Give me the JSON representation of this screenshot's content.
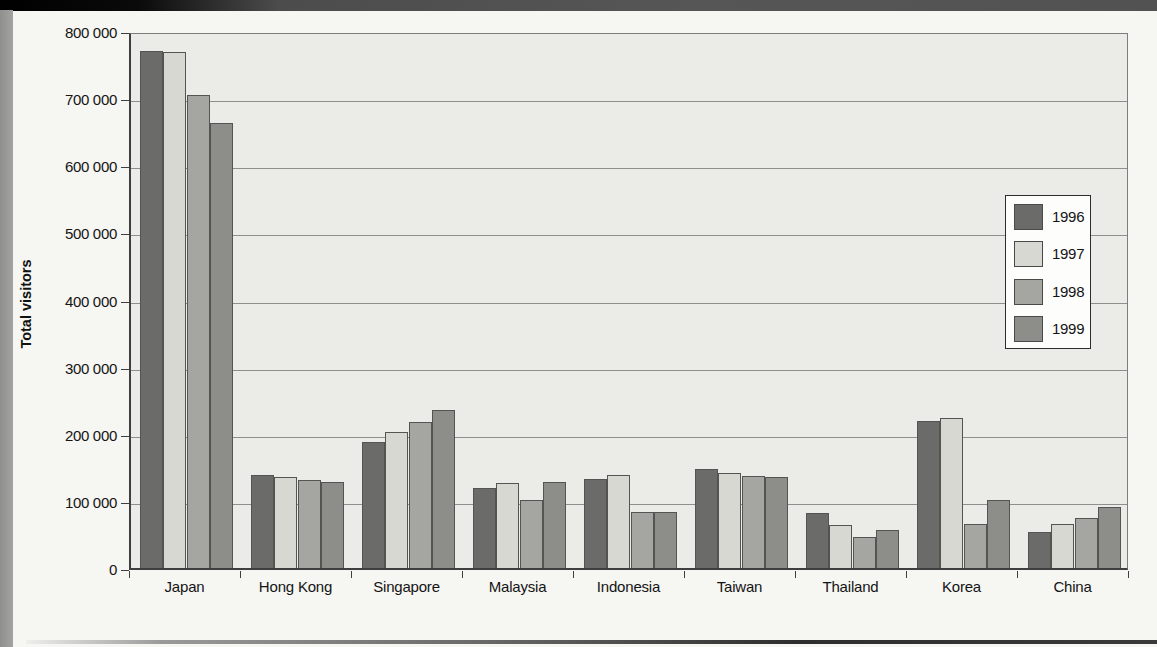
{
  "ui": {
    "top_bar": "header-band",
    "page_edge": "left-gutter",
    "bottom_rule": "page-rule"
  },
  "chart_data": {
    "type": "bar",
    "title": "",
    "xlabel": "",
    "ylabel": "Total visitors",
    "ylim": [
      0,
      800000
    ],
    "ytick_interval": 100000,
    "ytick_labels": [
      "0",
      "100 000",
      "200 000",
      "300 000",
      "400 000",
      "500 000",
      "600 000",
      "700 000",
      "800 000"
    ],
    "grid": "horizontal",
    "legend_position": "right-inside",
    "categories": [
      "Japan",
      "Hong Kong",
      "Singapore",
      "Malaysia",
      "Indonesia",
      "Taiwan",
      "Thailand",
      "Korea",
      "China"
    ],
    "series": [
      {
        "name": "1996",
        "color": "#6b6b69",
        "values": [
          770000,
          138000,
          187000,
          119000,
          132000,
          147000,
          82000,
          219000,
          54000
        ]
      },
      {
        "name": "1997",
        "color": "#d8d8d3",
        "values": [
          768000,
          136000,
          202000,
          126000,
          139000,
          141000,
          64000,
          224000,
          66000
        ]
      },
      {
        "name": "1998",
        "color": "#a5a5a1",
        "values": [
          704000,
          131000,
          217000,
          102000,
          83000,
          137000,
          46000,
          65000,
          75000
        ]
      },
      {
        "name": "1999",
        "color": "#8d8d89",
        "values": [
          663000,
          128000,
          236000,
          128000,
          84000,
          136000,
          57000,
          101000,
          91000
        ]
      }
    ]
  }
}
